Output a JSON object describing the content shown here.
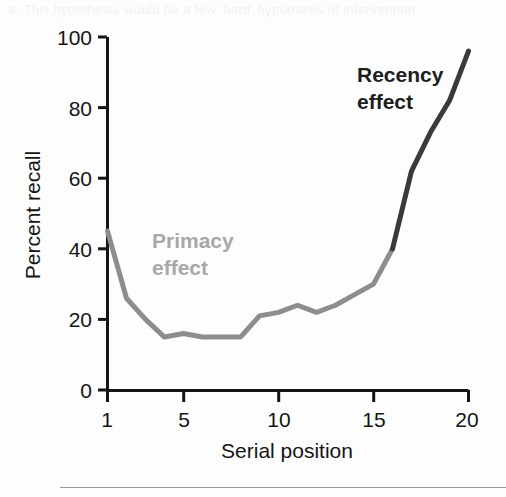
{
  "figure": {
    "background_color": "#fdfdfd",
    "axis_color": "#151515"
  },
  "chart_data": {
    "type": "line",
    "title": "",
    "subtitle": "",
    "xlabel": "Serial position",
    "ylabel": "Percent recall",
    "xlim": [
      1,
      20
    ],
    "ylim": [
      0,
      100
    ],
    "grid": false,
    "legend_position": "none",
    "x_ticks": [
      "1",
      "5",
      "10",
      "15",
      "20"
    ],
    "x_tick_values": [
      1,
      5,
      10,
      15,
      20
    ],
    "y_ticks": [
      "0",
      "20",
      "40",
      "60",
      "80",
      "100"
    ],
    "y_tick_values": [
      0,
      20,
      40,
      60,
      80,
      100
    ],
    "x": [
      1,
      2,
      3,
      4,
      5,
      6,
      7,
      8,
      9,
      10,
      11,
      12,
      13,
      14,
      15,
      16,
      17,
      18,
      19,
      20
    ],
    "values": [
      45,
      26,
      20,
      15,
      16,
      15,
      15,
      15,
      21,
      22,
      24,
      22,
      24,
      27,
      30,
      40,
      62,
      73,
      82,
      96
    ],
    "series": [
      {
        "name": "Primacy effect",
        "color": "#8d8d8d",
        "x": [
          1,
          2,
          3,
          4,
          5,
          6,
          7,
          8,
          9,
          10,
          11,
          12,
          13,
          14,
          15,
          16
        ],
        "values": [
          45,
          26,
          20,
          15,
          16,
          15,
          15,
          15,
          21,
          22,
          24,
          22,
          24,
          27,
          30,
          40
        ]
      },
      {
        "name": "Recency effect",
        "color": "#3a3a3a",
        "x": [
          16,
          17,
          18,
          19,
          20
        ],
        "values": [
          40,
          62,
          73,
          82,
          96
        ]
      }
    ],
    "annotations": [
      {
        "id": "primacy",
        "text_line1": "Primacy",
        "text_line2": "effect",
        "color": "#a8a8a8",
        "x": 2.6,
        "y": 46
      },
      {
        "id": "recency",
        "text_line1": "Recency",
        "text_line2": "effect",
        "color": "#1e1e1e",
        "x": 14.6,
        "y": 92
      }
    ]
  },
  "artifacts": {
    "top_bleed_text": "a. This hypothesis would be a few 'hard' hypothesis of intervention",
    "bottom_bleed_text": "                                                         "
  }
}
